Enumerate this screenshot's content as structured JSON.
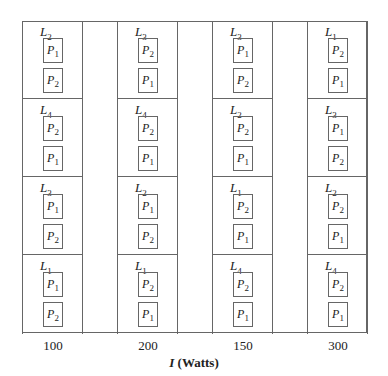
{
  "chart_data": {
    "type": "table",
    "title": "",
    "xlabel": "I (Watts)",
    "columns": [
      {
        "level": "100",
        "plots": [
          {
            "label": "L",
            "sub": "2",
            "subplots": [
              {
                "p": "P",
                "sub": "1"
              },
              {
                "p": "P",
                "sub": "2"
              }
            ]
          },
          {
            "label": "L",
            "sub": "4",
            "subplots": [
              {
                "p": "P",
                "sub": "2"
              },
              {
                "p": "P",
                "sub": "1"
              }
            ]
          },
          {
            "label": "L",
            "sub": "3",
            "subplots": [
              {
                "p": "P",
                "sub": "1"
              },
              {
                "p": "P",
                "sub": "2"
              }
            ]
          },
          {
            "label": "L",
            "sub": "1",
            "subplots": [
              {
                "p": "P",
                "sub": "1"
              },
              {
                "p": "P",
                "sub": "2"
              }
            ]
          }
        ]
      },
      {
        "level": "200",
        "plots": [
          {
            "label": "L",
            "sub": "3",
            "subplots": [
              {
                "p": "P",
                "sub": "2"
              },
              {
                "p": "P",
                "sub": "1"
              }
            ]
          },
          {
            "label": "L",
            "sub": "4",
            "subplots": [
              {
                "p": "P",
                "sub": "2"
              },
              {
                "p": "P",
                "sub": "1"
              }
            ]
          },
          {
            "label": "L",
            "sub": "2",
            "subplots": [
              {
                "p": "P",
                "sub": "1"
              },
              {
                "p": "P",
                "sub": "2"
              }
            ]
          },
          {
            "label": "L",
            "sub": "1",
            "subplots": [
              {
                "p": "P",
                "sub": "2"
              },
              {
                "p": "P",
                "sub": "1"
              }
            ]
          }
        ]
      },
      {
        "level": "150",
        "plots": [
          {
            "label": "L",
            "sub": "3",
            "subplots": [
              {
                "p": "P",
                "sub": "1"
              },
              {
                "p": "P",
                "sub": "2"
              }
            ]
          },
          {
            "label": "L",
            "sub": "2",
            "subplots": [
              {
                "p": "P",
                "sub": "2"
              },
              {
                "p": "P",
                "sub": "1"
              }
            ]
          },
          {
            "label": "L",
            "sub": "1",
            "subplots": [
              {
                "p": "P",
                "sub": "2"
              },
              {
                "p": "P",
                "sub": "1"
              }
            ]
          },
          {
            "label": "L",
            "sub": "4",
            "subplots": [
              {
                "p": "P",
                "sub": "2"
              },
              {
                "p": "P",
                "sub": "1"
              }
            ]
          }
        ]
      },
      {
        "level": "300",
        "plots": [
          {
            "label": "L",
            "sub": "1",
            "subplots": [
              {
                "p": "P",
                "sub": "2"
              },
              {
                "p": "P",
                "sub": "1"
              }
            ]
          },
          {
            "label": "L",
            "sub": "3",
            "subplots": [
              {
                "p": "P",
                "sub": "1"
              },
              {
                "p": "P",
                "sub": "2"
              }
            ]
          },
          {
            "label": "L",
            "sub": "2",
            "subplots": [
              {
                "p": "P",
                "sub": "2"
              },
              {
                "p": "P",
                "sub": "1"
              }
            ]
          },
          {
            "label": "L",
            "sub": "4",
            "subplots": [
              {
                "p": "P",
                "sub": "2"
              },
              {
                "p": "P",
                "sub": "1"
              }
            ]
          }
        ]
      }
    ]
  },
  "axis": {
    "var": "I",
    "unit": "(Watts)"
  },
  "colors": {
    "line": "#666666",
    "text": "#222222"
  }
}
